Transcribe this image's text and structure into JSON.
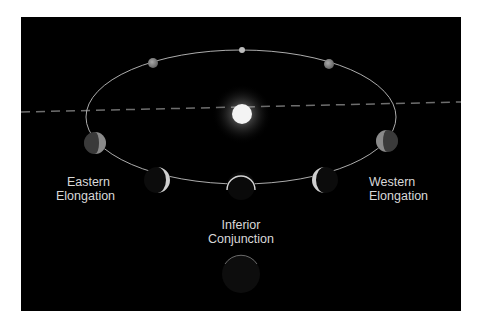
{
  "diagram": {
    "colors": {
      "background": "#000000",
      "frame": "#ffffff",
      "orbit": "#bfbfbf",
      "sun": "#f4f4f4",
      "label": "#d8d8d8"
    },
    "sun": {
      "name": "Sun",
      "cx": 242,
      "cy": 114
    },
    "orbit": {
      "cx": 241,
      "cy": 117,
      "rx": 155,
      "ry": 67
    },
    "planets": [
      {
        "name": "superior-conjunction",
        "cx": 242,
        "cy": 50,
        "r": 3,
        "phase": "full"
      },
      {
        "name": "top-left",
        "cx": 153,
        "cy": 63,
        "r": 5,
        "phase": "gibbous"
      },
      {
        "name": "top-right",
        "cx": 329,
        "cy": 64,
        "r": 5,
        "phase": "gibbous"
      },
      {
        "name": "left-quadrature",
        "cx": 95,
        "cy": 143,
        "r": 11,
        "phase": "half"
      },
      {
        "name": "right-quadrature",
        "cx": 387,
        "cy": 141,
        "r": 11,
        "phase": "half"
      },
      {
        "name": "eastern-elongation",
        "cx": 157,
        "cy": 180,
        "r": 13,
        "phase": "crescent-right"
      },
      {
        "name": "western-elongation",
        "cx": 325,
        "cy": 180,
        "r": 13,
        "phase": "crescent-left"
      },
      {
        "name": "near-inferior",
        "cx": 241,
        "cy": 186,
        "r": 14,
        "phase": "thin-top"
      },
      {
        "name": "inferior-conjunction",
        "cx": 241,
        "cy": 274,
        "r": 19,
        "phase": "new"
      }
    ],
    "labels": {
      "eastern": [
        "Eastern",
        "Elongation"
      ],
      "western": [
        "Western",
        "Elongation"
      ],
      "inferior": [
        "Inferior",
        "Conjunction"
      ]
    }
  }
}
